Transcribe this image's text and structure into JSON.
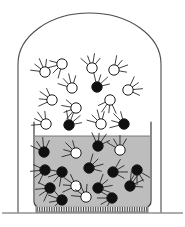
{
  "figure": {
    "caption": "",
    "width": 185,
    "height": 227,
    "background_color": "#ffffff"
  },
  "colors": {
    "outline": "#4a4a4a",
    "beaker_outline": "#3c3c3c",
    "liquid_fill": "#bdbdbd",
    "liquid_surface_line": "#6e6e6e",
    "gas_region_fill": "#ffffff",
    "particle_dark_fill": "#101010",
    "particle_light_fill": "#ffffff",
    "particle_stroke": "#1a1a1a",
    "trail_stroke": "#1f1f1f",
    "base_fill": "#e8e8e8",
    "base_hatch": "#2b2b2b",
    "ground_line": "#5a5a5a"
  },
  "bell_jar": {
    "label": "bell-jar",
    "left_x": 18,
    "right_x": 161,
    "dome_top_y": 13,
    "shoulder_y": 64,
    "bottom_y": 212,
    "stroke_width": 1.1
  },
  "beaker": {
    "label": "beaker",
    "left_x": 34,
    "right_x": 151,
    "rim_y": 122,
    "bottom_y": 207,
    "corner_radius": 6,
    "stroke_width": 1.2
  },
  "liquid": {
    "label": "liquid",
    "surface_y": 136,
    "bottom_y": 205,
    "left_x": 35,
    "right_x": 150,
    "fill": "#bdbdbd"
  },
  "base": {
    "label": "heating-base",
    "left_x": 36,
    "right_x": 148,
    "top_y": 206,
    "bottom_y": 212,
    "hatch_count": 46
  },
  "ground": {
    "label": "bench-surface",
    "left_x": 2,
    "right_x": 183,
    "y": 213
  },
  "legend": {
    "gas_phase_label": "",
    "liquid_phase_label": ""
  },
  "particles": {
    "radius": 5.2,
    "gas_phase": [
      {
        "cx": 45,
        "cy": 72,
        "type": "light",
        "trail_angle": 128
      },
      {
        "cx": 62,
        "cy": 64,
        "type": "light",
        "trail_angle": 210
      },
      {
        "cx": 92,
        "cy": 68,
        "type": "light",
        "trail_angle": 95
      },
      {
        "cx": 114,
        "cy": 70,
        "type": "light",
        "trail_angle": 35
      },
      {
        "cx": 72,
        "cy": 88,
        "type": "light",
        "trail_angle": 118
      },
      {
        "cx": 97,
        "cy": 87,
        "type": "dark",
        "trail_angle": 58
      },
      {
        "cx": 128,
        "cy": 90,
        "type": "light",
        "trail_angle": 20
      },
      {
        "cx": 52,
        "cy": 100,
        "type": "light",
        "trail_angle": 160
      },
      {
        "cx": 76,
        "cy": 108,
        "type": "light",
        "trail_angle": 185
      },
      {
        "cx": 110,
        "cy": 100,
        "type": "light",
        "trail_angle": 250
      },
      {
        "cx": 46,
        "cy": 124,
        "type": "light",
        "trail_angle": 140
      },
      {
        "cx": 69,
        "cy": 125,
        "type": "dark",
        "trail_angle": 55
      },
      {
        "cx": 101,
        "cy": 124,
        "type": "light",
        "trail_angle": 120
      },
      {
        "cx": 124,
        "cy": 124,
        "type": "dark",
        "trail_angle": 150
      }
    ],
    "liquid_phase": [
      {
        "cx": 44,
        "cy": 152,
        "type": "dark",
        "trail_angle": 110
      },
      {
        "cx": 76,
        "cy": 153,
        "type": "light",
        "trail_angle": 150
      },
      {
        "cx": 98,
        "cy": 146,
        "type": "dark",
        "trail_angle": 70
      },
      {
        "cx": 120,
        "cy": 150,
        "type": "light",
        "trail_angle": 105
      },
      {
        "cx": 45,
        "cy": 170,
        "type": "dark",
        "trail_angle": 200
      },
      {
        "cx": 62,
        "cy": 172,
        "type": "dark",
        "trail_angle": 215
      },
      {
        "cx": 89,
        "cy": 168,
        "type": "dark",
        "trail_angle": 30
      },
      {
        "cx": 113,
        "cy": 172,
        "type": "dark",
        "trail_angle": 15
      },
      {
        "cx": 137,
        "cy": 170,
        "type": "dark",
        "trail_angle": 285
      },
      {
        "cx": 130,
        "cy": 186,
        "type": "dark",
        "trail_angle": 40
      },
      {
        "cx": 50,
        "cy": 188,
        "type": "dark",
        "trail_angle": 200
      },
      {
        "cx": 76,
        "cy": 186,
        "type": "light",
        "trail_angle": 160
      },
      {
        "cx": 98,
        "cy": 188,
        "type": "dark",
        "trail_angle": 25
      },
      {
        "cx": 62,
        "cy": 200,
        "type": "dark",
        "trail_angle": 175
      },
      {
        "cx": 86,
        "cy": 197,
        "type": "light",
        "trail_angle": 130
      },
      {
        "cx": 112,
        "cy": 198,
        "type": "dark",
        "trail_angle": 195
      }
    ]
  }
}
